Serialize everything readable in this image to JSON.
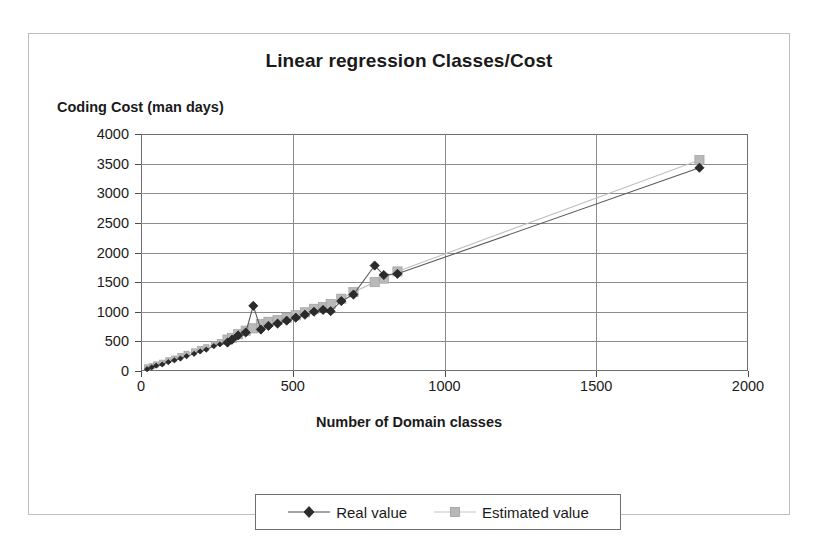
{
  "chart": {
    "title": "Linear regression Classes/Cost",
    "y_axis_title": "Coding Cost (man days)",
    "x_axis_title": "Number of Domain classes"
  },
  "legend": {
    "items": [
      {
        "label": "Real value",
        "marker": "diamond-marker-icon",
        "color": "#333333"
      },
      {
        "label": "Estimated value",
        "marker": "square-marker-icon",
        "color": "#b3b3b3"
      }
    ]
  },
  "chart_data": {
    "type": "scatter",
    "title": "Linear regression Classes/Cost",
    "xlabel": "Number of Domain classes",
    "ylabel": "Coding Cost (man days)",
    "xlim": [
      0,
      2000
    ],
    "ylim": [
      0,
      4000
    ],
    "xticks": [
      0,
      500,
      1000,
      1500,
      2000
    ],
    "yticks": [
      0,
      500,
      1000,
      1500,
      2000,
      2500,
      3000,
      3500,
      4000
    ],
    "grid": true,
    "legend_position": "bottom",
    "series": [
      {
        "name": "Real value",
        "color": "#333333",
        "marker": "diamond",
        "points": [
          [
            20,
            30
          ],
          [
            35,
            60
          ],
          [
            50,
            90
          ],
          [
            70,
            110
          ],
          [
            90,
            150
          ],
          [
            110,
            180
          ],
          [
            130,
            210
          ],
          [
            150,
            250
          ],
          [
            175,
            290
          ],
          [
            195,
            330
          ],
          [
            215,
            360
          ],
          [
            240,
            420
          ],
          [
            260,
            450
          ],
          [
            285,
            480
          ],
          [
            300,
            530
          ],
          [
            320,
            600
          ],
          [
            345,
            650
          ],
          [
            370,
            1100
          ],
          [
            395,
            700
          ],
          [
            420,
            760
          ],
          [
            450,
            800
          ],
          [
            480,
            850
          ],
          [
            510,
            900
          ],
          [
            540,
            950
          ],
          [
            570,
            1000
          ],
          [
            600,
            1030
          ],
          [
            625,
            1010
          ],
          [
            660,
            1180
          ],
          [
            700,
            1290
          ],
          [
            770,
            1780
          ],
          [
            800,
            1620
          ],
          [
            845,
            1640
          ],
          [
            1840,
            3430
          ]
        ]
      },
      {
        "name": "Estimated value",
        "color": "#b3b3b3",
        "marker": "square",
        "points": [
          [
            20,
            60
          ],
          [
            35,
            80
          ],
          [
            50,
            110
          ],
          [
            70,
            140
          ],
          [
            90,
            180
          ],
          [
            110,
            210
          ],
          [
            130,
            250
          ],
          [
            150,
            290
          ],
          [
            175,
            330
          ],
          [
            195,
            370
          ],
          [
            215,
            400
          ],
          [
            240,
            450
          ],
          [
            260,
            490
          ],
          [
            285,
            530
          ],
          [
            300,
            560
          ],
          [
            320,
            620
          ],
          [
            345,
            680
          ],
          [
            370,
            720
          ],
          [
            395,
            790
          ],
          [
            420,
            830
          ],
          [
            450,
            860
          ],
          [
            480,
            900
          ],
          [
            510,
            940
          ],
          [
            540,
            990
          ],
          [
            570,
            1050
          ],
          [
            600,
            1080
          ],
          [
            625,
            1130
          ],
          [
            660,
            1220
          ],
          [
            700,
            1330
          ],
          [
            770,
            1500
          ],
          [
            800,
            1560
          ],
          [
            845,
            1680
          ],
          [
            1840,
            3560
          ]
        ]
      }
    ]
  }
}
